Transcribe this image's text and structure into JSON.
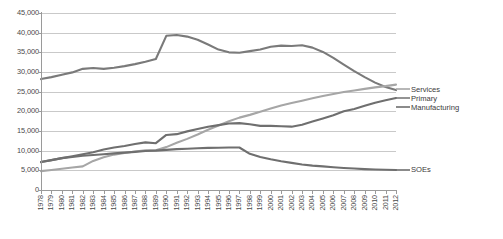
{
  "chart_data": {
    "type": "line",
    "title": "",
    "subtitle": "",
    "xlabel": "",
    "ylabel": "",
    "xlim": [
      1978,
      2012
    ],
    "ylim": [
      0,
      45000
    ],
    "ytick_step": 5000,
    "grid": true,
    "legend_position": "right-inline",
    "categories": [
      "1978",
      "1979",
      "1980",
      "1981",
      "1982",
      "1983",
      "1984",
      "1985",
      "1986",
      "1987",
      "1988",
      "1989",
      "1990",
      "1991",
      "1992",
      "1993",
      "1994",
      "1995",
      "1996",
      "1997",
      "1998",
      "1999",
      "2000",
      "2001",
      "2002",
      "2003",
      "2004",
      "2005",
      "2006",
      "2007",
      "2008",
      "2009",
      "2010",
      "2011",
      "2012"
    ],
    "ytick_labels": [
      "0",
      "5,000",
      "10,000",
      "15,000",
      "20,000",
      "25,000",
      "30,000",
      "35,000",
      "40,000",
      "45,000"
    ],
    "ytick_values": [
      0,
      5000,
      10000,
      15000,
      20000,
      25000,
      30000,
      35000,
      40000,
      45000
    ],
    "series": [
      {
        "name": "Primary",
        "color": "#7a7a7a",
        "values": [
          28200,
          28700,
          29300,
          29900,
          30800,
          31000,
          30800,
          31100,
          31500,
          32000,
          32600,
          33300,
          39200,
          39400,
          39000,
          38200,
          37000,
          35700,
          35000,
          34900,
          35300,
          35700,
          36400,
          36700,
          36600,
          36800,
          36200,
          35100,
          33600,
          31900,
          30200,
          28700,
          27300,
          26200,
          25400
        ]
      },
      {
        "name": "Services",
        "color": "#a6a6a6",
        "values": [
          4800,
          5100,
          5400,
          5700,
          6000,
          7400,
          8300,
          9000,
          9400,
          9800,
          10100,
          10100,
          10900,
          12000,
          13000,
          14100,
          15300,
          16400,
          17500,
          18400,
          19100,
          19900,
          20700,
          21500,
          22100,
          22700,
          23300,
          23900,
          24400,
          24900,
          25300,
          25700,
          26100,
          26400,
          26800
        ]
      },
      {
        "name": "Manufacturing",
        "color": "#6f6f6f",
        "values": [
          7100,
          7600,
          8100,
          8600,
          9100,
          9600,
          10300,
          10800,
          11200,
          11700,
          12100,
          11900,
          14000,
          14200,
          14900,
          15500,
          16100,
          16500,
          16900,
          17000,
          16700,
          16300,
          16300,
          16200,
          16100,
          16600,
          17400,
          18200,
          19000,
          20000,
          20600,
          21400,
          22200,
          22800,
          23400
        ]
      },
      {
        "name": "SOEs",
        "color": "#6f6f6f",
        "values": [
          7100,
          7600,
          8100,
          8400,
          8700,
          8900,
          9100,
          9300,
          9500,
          9700,
          9900,
          10000,
          10200,
          10400,
          10500,
          10600,
          10700,
          10750,
          10800,
          10800,
          9200,
          8400,
          7800,
          7300,
          6900,
          6500,
          6200,
          6000,
          5800,
          5600,
          5450,
          5300,
          5200,
          5150,
          5100
        ]
      }
    ],
    "legend_labels": [
      {
        "name": "Services",
        "text": "Services"
      },
      {
        "name": "Primary",
        "text": "Primary"
      },
      {
        "name": "Manufacturing",
        "text": "Manufacturing"
      },
      {
        "name": "SOEs",
        "text": "SOEs"
      }
    ]
  }
}
